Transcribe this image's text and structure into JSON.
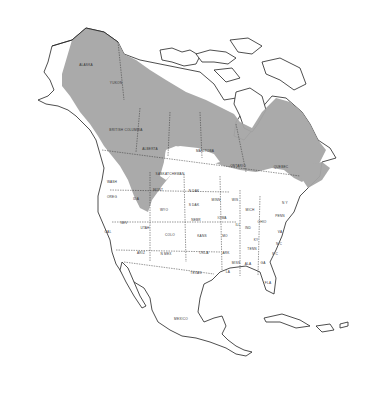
{
  "map": {
    "subject": "Species range map of North America",
    "colors": {
      "range": "#a6a6a6",
      "land": "#ffffff",
      "border": "#222222",
      "background": "#ffffff"
    },
    "labels": {
      "alaska": "ALASKA",
      "yukon": "YUKON",
      "british_columbia": "BRITISH COLUMBIA",
      "alberta": "ALBERTA",
      "saskatchewan": "SASKATCHEWAN",
      "manitoba": "MANITOBA",
      "ontario": "ONTARIO",
      "quebec": "QUEBEC",
      "wash": "WASH",
      "oreg": "OREG",
      "ida": "IDA",
      "mont": "MONT",
      "wyo": "WYO",
      "nev": "NEV",
      "cal": "CAL",
      "utah": "UTAH",
      "colo": "COLO",
      "ariz": "ARIZ",
      "n_mex": "N MEX",
      "n_dak": "N DAK",
      "s_dak": "S DAK",
      "nebr": "NEBR",
      "kans": "KANS",
      "okla": "OKLA",
      "texas": "TEXAS",
      "minn": "MINN",
      "iowa": "IOWA",
      "mo": "MO",
      "ark": "ARK",
      "la": "LA",
      "wis": "WIS",
      "ill": "ILL",
      "mich": "MICH",
      "ind": "IND",
      "ohio": "OHIO",
      "ky": "KY",
      "tenn": "TENN",
      "miss": "MISS",
      "ala": "ALA",
      "ga": "GA",
      "fla": "FLA",
      "sc": "S C",
      "nc": "N C",
      "va": "VA",
      "penn": "PENN",
      "ny": "N Y",
      "mexico": "MEXICO"
    }
  }
}
